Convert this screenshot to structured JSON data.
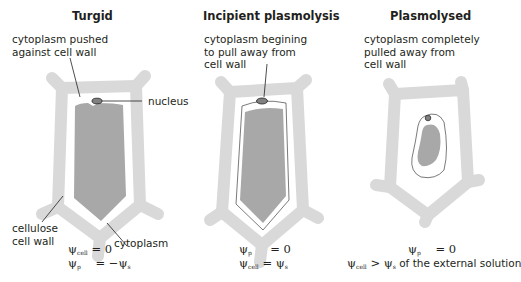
{
  "panels": [
    {
      "title": "Turgid",
      "annotation_top": "cytoplasm pushed\nagainst cell wall",
      "labels": {
        "nucleus": "nucleus",
        "cell_wall": "cellulose\ncell wall",
        "cytoplasm": "cytoplasm"
      },
      "equations": [
        {
          "symbol": "ψ",
          "sub": "cell",
          "rhs": "= 0"
        },
        {
          "symbol": "ψ",
          "sub": "p",
          "rhs": "= −ψ",
          "rhs_sub": "s"
        }
      ]
    },
    {
      "title": "Incipient plasmolysis",
      "annotation_top": "cytoplasm begining\nto pull away from\ncell wall",
      "equations": [
        {
          "symbol": "ψ",
          "sub": "p",
          "rhs": "= 0"
        },
        {
          "symbol": "ψ",
          "sub": "cell",
          "rhs": "= ψ",
          "rhs_sub": "s"
        }
      ]
    },
    {
      "title": "Plasmolysed",
      "annotation_top": "cytoplasm completely\npulled away from\ncell wall",
      "equations": [
        {
          "symbol": "ψ",
          "sub": "p",
          "rhs": "= 0"
        },
        {
          "symbol": "ψ",
          "sub": "cell",
          "rhs": "> ψ",
          "rhs_sub": "s",
          "rhs_tail": " of the external solution"
        }
      ]
    }
  ],
  "colors": {
    "cell_wall": "#d9d9d9",
    "cytoplasm": "#a8a8a8",
    "nucleus": "#808080",
    "outline": "#231f20",
    "background": "#ffffff"
  }
}
